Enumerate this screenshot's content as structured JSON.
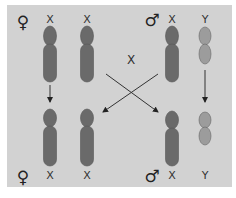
{
  "diagram": {
    "colors": {
      "panel_bg": "#d2d2d2",
      "x_chromosome": "#6a6a6a",
      "y_chromosome": "#9c9c9c",
      "outline": "#555555",
      "line": "#333333"
    },
    "parents": {
      "female": {
        "symbol": "♀",
        "chromosomes": [
          "X",
          "X"
        ]
      },
      "male": {
        "symbol": "♂",
        "chromosomes": [
          "X",
          "Y"
        ]
      }
    },
    "cross_label": "X",
    "offspring": {
      "female": {
        "symbol": "♀",
        "chromosomes": [
          "X",
          "X"
        ]
      },
      "male": {
        "symbol": "♂",
        "chromosomes": [
          "X",
          "Y"
        ]
      }
    }
  }
}
